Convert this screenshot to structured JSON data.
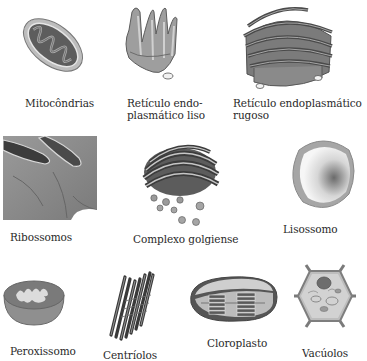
{
  "figure": {
    "organelles": [
      {
        "id": "mitocondrias",
        "label": "Mitocôndrias"
      },
      {
        "id": "reticulo-liso",
        "label_line1": "Retículo endo-",
        "label_line2": "plasmático liso"
      },
      {
        "id": "reticulo-rugoso",
        "label_line1": "Retículo endoplasmático",
        "label_line2": "rugoso"
      },
      {
        "id": "ribossomos",
        "label": "Ribossomos"
      },
      {
        "id": "complexo-golgiense",
        "label": "Complexo golgiense"
      },
      {
        "id": "lisossomo",
        "label": "Lisossomo"
      },
      {
        "id": "peroxissomo",
        "label": "Peroxissomo"
      },
      {
        "id": "centriolos",
        "label": "Centríolos"
      },
      {
        "id": "cloroplasto",
        "label": "Cloroplasto"
      },
      {
        "id": "vacuolos",
        "label": "Vacúolos"
      }
    ]
  },
  "colors": {
    "background": "#ffffff",
    "text": "#2a2a2a",
    "membrane_light": "#c9c9c9",
    "membrane_mid": "#8c8c8c",
    "membrane_dark": "#4a4a4a"
  }
}
